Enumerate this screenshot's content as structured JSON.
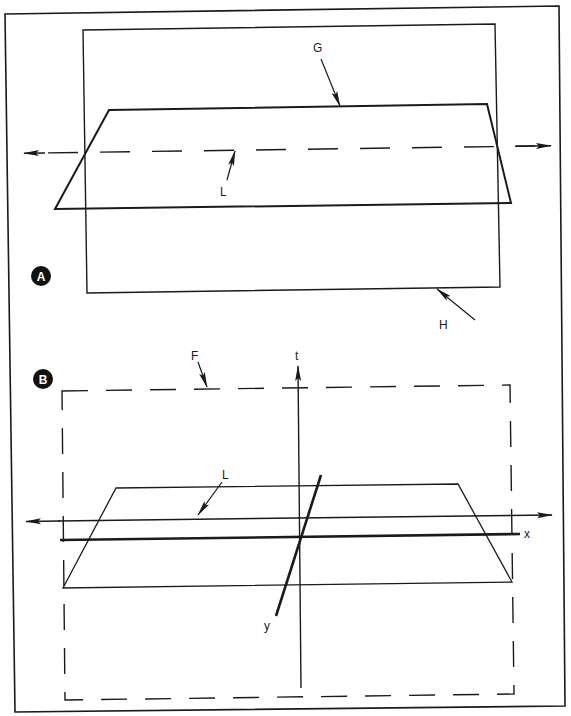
{
  "figure": {
    "panels": [
      {
        "id": "A",
        "badge": "A",
        "labels": {
          "G": "G",
          "L": "L",
          "H": "H"
        },
        "description": "Plane G intersecting plane H along line L"
      },
      {
        "id": "B",
        "badge": "B",
        "labels": {
          "F": "F",
          "t": "t",
          "L": "L",
          "x": "x",
          "y": "y"
        },
        "description": "Line L in plane of x-y axes with t axis, inside dashed frame F"
      }
    ],
    "colors": {
      "ink": "#1a1a1a",
      "background": "#ffffff",
      "badge_fill": "#111111",
      "badge_text": "#ffffff"
    }
  }
}
